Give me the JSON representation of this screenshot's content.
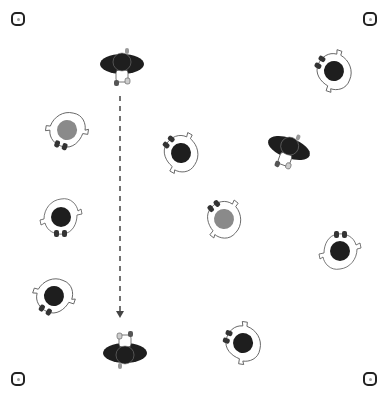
{
  "diagram": {
    "type": "drill-diagram",
    "colors": {
      "background": "#ffffff",
      "player_dark": "#1e1e1e",
      "player_gray": "#8a8a8a",
      "outline": "#555555",
      "arrow": "#444444",
      "cone": "#222222"
    },
    "cones": [
      {
        "id": "cone-top-left",
        "x": 11,
        "y": 12
      },
      {
        "id": "cone-top-right",
        "x": 363,
        "y": 12
      },
      {
        "id": "cone-bottom-left",
        "x": 11,
        "y": 372
      },
      {
        "id": "cone-bottom-right",
        "x": 363,
        "y": 372
      }
    ],
    "players": [
      {
        "id": "player-1",
        "x": 122,
        "y": 64,
        "rotation": 0,
        "style": "dark-wide",
        "team": "dark"
      },
      {
        "id": "player-2",
        "x": 67,
        "y": 130,
        "rotation": 110,
        "style": "open",
        "team": "gray"
      },
      {
        "id": "player-3",
        "x": 181,
        "y": 153,
        "rotation": 220,
        "style": "open",
        "team": "dark"
      },
      {
        "id": "player-4",
        "x": 334,
        "y": 71,
        "rotation": 210,
        "style": "open",
        "team": "dark"
      },
      {
        "id": "player-5",
        "x": 289,
        "y": 148,
        "rotation": 20,
        "style": "dark-wide",
        "team": "dark"
      },
      {
        "id": "player-6",
        "x": 61,
        "y": 217,
        "rotation": 90,
        "style": "open",
        "team": "dark"
      },
      {
        "id": "player-7",
        "x": 224,
        "y": 219,
        "rotation": 230,
        "style": "open",
        "team": "gray"
      },
      {
        "id": "player-8",
        "x": 340,
        "y": 251,
        "rotation": 270,
        "style": "open",
        "team": "dark"
      },
      {
        "id": "player-9",
        "x": 54,
        "y": 296,
        "rotation": 120,
        "style": "open",
        "team": "dark"
      },
      {
        "id": "player-10",
        "x": 125,
        "y": 353,
        "rotation": 180,
        "style": "dark-wide",
        "team": "dark"
      },
      {
        "id": "player-11",
        "x": 243,
        "y": 343,
        "rotation": 200,
        "style": "open",
        "team": "dark"
      }
    ],
    "arrows": [
      {
        "id": "run-arrow",
        "x1": 120,
        "y1": 96,
        "x2": 120,
        "y2": 318,
        "style": "dashed"
      }
    ]
  }
}
